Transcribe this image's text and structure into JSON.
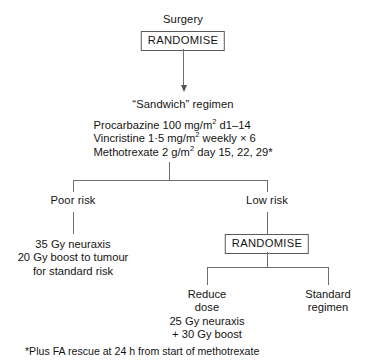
{
  "diagram": {
    "title_node": "Surgery",
    "randomise_top": "RANDOMISE",
    "regimen_heading": "“Sandwich” regimen",
    "regimen_drugs": [
      {
        "name": "Procarbazine",
        "dose": "100 mg/m",
        "exponent": "2",
        "schedule": " d1–14"
      },
      {
        "name": "Vincristine",
        "dose": "1·5 mg/m",
        "exponent": "2",
        "schedule": " weekly × 6"
      },
      {
        "name": "Methotrexate",
        "dose": "2 g/m",
        "exponent": "2",
        "schedule": " day 15, 22, 29*"
      }
    ],
    "branch_left_label": "Poor risk",
    "branch_right_label": "Low risk",
    "poor_risk_treatment": [
      "35 Gy neuraxis",
      "20 Gy boost to tumour",
      "for standard risk"
    ],
    "randomise_second": "RANDOMISE",
    "low_risk_arm_a": [
      "Reduce",
      "dose",
      "25 Gy neuraxis",
      "+ 30 Gy boost"
    ],
    "low_risk_arm_b": [
      "Standard",
      "regimen"
    ],
    "footnote": "*Plus FA rescue at 24 h from start of methotrexate"
  }
}
